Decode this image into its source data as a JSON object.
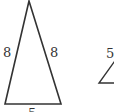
{
  "diagram": {
    "type": "triangles",
    "stroke_color": "#333333",
    "triangle_1": {
      "kind": "isosceles",
      "left_side_label": "8",
      "right_side_label": "8",
      "base_label": "5"
    },
    "triangle_2": {
      "kind": "partial",
      "side_label": "5"
    }
  }
}
